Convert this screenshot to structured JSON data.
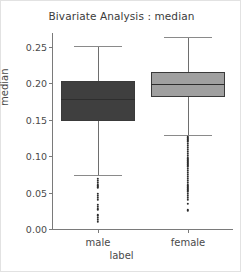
{
  "chart_data": {
    "type": "boxplot",
    "title": "Bivariate Analysis : median",
    "xlabel": "label",
    "ylabel": "median",
    "categories": [
      "male",
      "female"
    ],
    "ylim": [
      0.0,
      0.2686
    ],
    "yticks": [
      0.0,
      0.05,
      0.1,
      0.15,
      0.2,
      0.25
    ],
    "ytick_labels": [
      "0.00",
      "0.05",
      "0.10",
      "0.15",
      "0.20",
      "0.25"
    ],
    "grid": false,
    "legend": null,
    "boxes": [
      {
        "name": "male",
        "color": "#3f3f3f",
        "whisker_low": 0.0743,
        "q1": 0.1486,
        "median": 0.1786,
        "q3": 0.2029,
        "whisker_high": 0.2514,
        "fliers": [
          0.0686,
          0.0657,
          0.0629,
          0.06,
          0.0571,
          0.0486,
          0.0457,
          0.0429,
          0.04,
          0.0329,
          0.03,
          0.0271,
          0.0186,
          0.0157,
          0.0129,
          0.01
        ]
      },
      {
        "name": "female",
        "color": "#a0a0a0",
        "whisker_low": 0.1286,
        "q1": 0.1814,
        "median": 0.1986,
        "q3": 0.2157,
        "whisker_high": 0.2629,
        "fliers": [
          0.1257,
          0.1229,
          0.12,
          0.1171,
          0.1143,
          0.1114,
          0.1086,
          0.1057,
          0.1029,
          0.1,
          0.0971,
          0.0943,
          0.0914,
          0.0886,
          0.0857,
          0.0829,
          0.08,
          0.0771,
          0.0743,
          0.0714,
          0.0686,
          0.0657,
          0.0629,
          0.06,
          0.0571,
          0.0543,
          0.0514,
          0.0486,
          0.0457,
          0.0429,
          0.04,
          0.0343,
          0.0257
        ]
      }
    ]
  }
}
